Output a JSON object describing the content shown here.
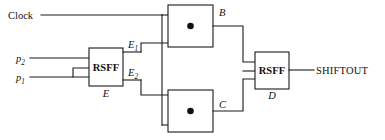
{
  "diagram": {
    "title_text": "Clock",
    "type": "logic-circuit-schematic",
    "labels": {
      "clock": "Clock",
      "p2": "p",
      "p2_sub": "2",
      "p1": "p",
      "p1_sub": "1",
      "e1": "E",
      "e1_sub": "1",
      "e2": "E",
      "e2_sub": "2",
      "e_name": "E",
      "b_name": "B",
      "c_name": "C",
      "d_name": "D",
      "rsff_left": "RSFF",
      "rsff_right": "RSFF",
      "shiftout": "SHIFTOUT"
    },
    "blocks": [
      {
        "id": "rsff-e",
        "label": "RSFF",
        "name": "E",
        "x": 89,
        "y": 48,
        "w": 34,
        "h": 38,
        "kind": "flip-flop"
      },
      {
        "id": "delay-b",
        "label": "",
        "name": "B",
        "x": 168,
        "y": 5,
        "w": 45,
        "h": 42,
        "kind": "delay"
      },
      {
        "id": "delay-c",
        "label": "",
        "name": "C",
        "x": 168,
        "y": 90,
        "w": 45,
        "h": 42,
        "kind": "delay"
      },
      {
        "id": "rsff-d",
        "label": "RSFF",
        "name": "D",
        "x": 255,
        "y": 52,
        "w": 34,
        "h": 37,
        "kind": "flip-flop"
      }
    ],
    "signals": [
      {
        "name": "Clock",
        "role": "input"
      },
      {
        "name": "p2",
        "role": "input"
      },
      {
        "name": "p1",
        "role": "input"
      },
      {
        "name": "E1",
        "role": "internal"
      },
      {
        "name": "E2",
        "role": "internal"
      },
      {
        "name": "B",
        "role": "internal"
      },
      {
        "name": "C",
        "role": "internal"
      },
      {
        "name": "SHIFTOUT",
        "role": "output"
      }
    ],
    "colors": {
      "wire": "#1a1a1a",
      "box_fill": "#ffffff",
      "dot": "#111111",
      "background": "#ffffff",
      "text": "#111111"
    }
  }
}
